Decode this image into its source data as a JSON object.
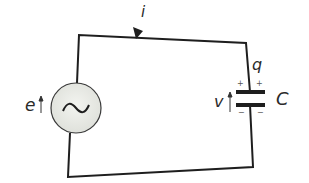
{
  "diagram": {
    "type": "circuit",
    "labels": {
      "current": "i",
      "charge": "q",
      "source_emf": "e",
      "capacitor_voltage": "v",
      "capacitance": "C"
    },
    "capacitor_signs": {
      "top_left": "+",
      "top_right": "+",
      "bottom_left": "−",
      "bottom_right": "−"
    },
    "source_symbol": "~",
    "colors": {
      "wire": "#1e1e1e",
      "source_fill": "#e9ebe6",
      "text": "#2a2a2a"
    }
  }
}
